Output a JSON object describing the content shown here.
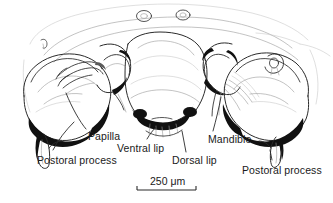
{
  "figure": {
    "background_color": "#ffffff",
    "ink_color": "#2b2b2b",
    "text_color": "#1a1a1a",
    "width": 333,
    "height": 203
  },
  "labels": [
    {
      "id": "papilla",
      "text": "Papilla",
      "x": 88,
      "y": 131
    },
    {
      "id": "postoral-process-left",
      "text": "Postoral process",
      "x": 37,
      "y": 155
    },
    {
      "id": "ventral-lip",
      "text": "Ventral lip",
      "x": 117,
      "y": 143
    },
    {
      "id": "dorsal-lip",
      "text": "Dorsal lip",
      "x": 172,
      "y": 155
    },
    {
      "id": "mandible",
      "text": "Mandible",
      "x": 208,
      "y": 134
    },
    {
      "id": "postoral-process-right",
      "text": "Postoral process",
      "x": 242,
      "y": 165
    }
  ],
  "scale_bar": {
    "text": "250 μm",
    "value": 250,
    "unit": "μm",
    "label_x": 150,
    "label_y": 176,
    "bar_x1": 137,
    "bar_x2": 196,
    "bar_y": 190,
    "tick_height": 4
  }
}
